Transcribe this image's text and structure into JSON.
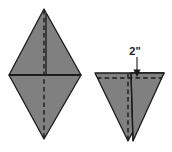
{
  "diagram": {
    "background_color": "#ffffff",
    "shape_fill_color": "#808080",
    "shape_outline_color": "#1a1a1a",
    "fold_line_color": "#1a1a1a",
    "annotation_color": "#1a1a1a",
    "figures": [
      {
        "name": "rhombus-figure",
        "description": "rhombus with horizontal crease and vertical dashed fold line",
        "vertices": {
          "top": [
            44,
            9
          ],
          "right": [
            81,
            75
          ],
          "bottom": [
            44,
            139
          ],
          "left": [
            9,
            75
          ]
        },
        "fold_lines": [
          {
            "name": "vertical-dashed-fold",
            "style": "dashed",
            "from": [
              44,
              9
            ],
            "to": [
              44,
              139
            ]
          },
          {
            "name": "horizontal-crease",
            "style": "solid",
            "from": [
              9,
              75
            ],
            "to": [
              81,
              75
            ]
          },
          {
            "name": "vertical-solid-crease",
            "style": "solid",
            "from": [
              46,
              13
            ],
            "to": [
              46,
              75
            ]
          }
        ]
      },
      {
        "name": "triangle-figure",
        "description": "downward pointing triangle with horizontal dashed fold line and vertical dashed fold line",
        "vertices": {
          "top_left": [
            95,
            73
          ],
          "top_right": [
            164,
            73
          ],
          "bottom": [
            128,
            141
          ]
        },
        "fold_lines": [
          {
            "name": "horizontal-dashed-fold",
            "style": "dashed",
            "from": [
              98,
              78
            ],
            "to": [
              161,
              78
            ]
          },
          {
            "name": "vertical-dashed-fold",
            "style": "dashed",
            "from": [
              128,
              73
            ],
            "to": [
              128,
              141
            ]
          },
          {
            "name": "flap-edge",
            "style": "solid",
            "from": [
              131,
              73
            ],
            "to": [
              133,
              141
            ]
          }
        ]
      }
    ],
    "annotations": [
      {
        "name": "measurement-2-inch",
        "label": "2\"",
        "label_x": 135,
        "label_y": 53,
        "arrow_from": [
          137,
          56
        ],
        "arrow_to": [
          137,
          76
        ],
        "points_to": "horizontal-dashed-fold"
      }
    ]
  }
}
